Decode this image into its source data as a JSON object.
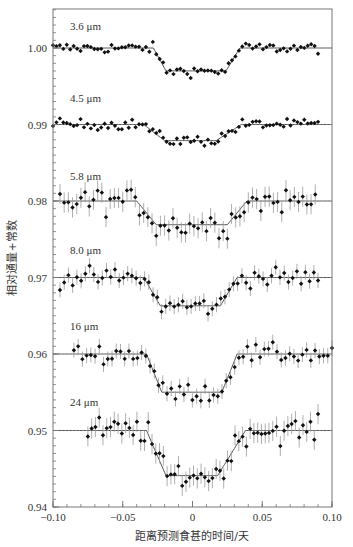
{
  "chart_data": {
    "type": "scatter",
    "title": "",
    "xlabel": "距离预测食甚的时间/天",
    "ylabel": "相对通量+常数",
    "xlim": [
      -0.1,
      0.1
    ],
    "ylim": [
      0.94,
      1.005
    ],
    "x_ticks": [
      -0.1,
      -0.05,
      0,
      0.05,
      0.1
    ],
    "x_tick_labels": [
      "−0.10",
      "−0.05",
      "0",
      "0.05",
      "0.10"
    ],
    "y_ticks": [
      0.94,
      0.95,
      0.96,
      0.97,
      0.98,
      0.99,
      1.0
    ],
    "y_tick_labels": [
      "0.94",
      "0.95",
      "0.96",
      "0.97",
      "0.98",
      "0.99",
      "1.00"
    ],
    "grid": false,
    "legend": "none (series labelled inline above each curve)",
    "series": [
      {
        "name": "3.6 μm",
        "baseline": 1.0,
        "depth": 0.003,
        "ingress": [
          -0.028,
          -0.019
        ],
        "egress": [
          0.024,
          0.034
        ],
        "errorbars": false,
        "noise": 0.0005,
        "x_range": [
          -0.1,
          0.09
        ]
      },
      {
        "name": "4.5 μm",
        "baseline": 0.99,
        "depth": 0.0021,
        "ingress": [
          -0.035,
          -0.02
        ],
        "egress": [
          0.017,
          0.035
        ],
        "errorbars": false,
        "noise": 0.0005,
        "x_range": [
          -0.1,
          0.09
        ]
      },
      {
        "name": "5.8 μm",
        "baseline": 0.98,
        "depth": 0.0031,
        "ingress": [
          -0.04,
          -0.026
        ],
        "egress": [
          0.025,
          0.039
        ],
        "errorbars": true,
        "noise": 0.0012,
        "x_range": [
          -0.095,
          0.088
        ]
      },
      {
        "name": "8.0 μm",
        "baseline": 0.97,
        "depth": 0.0037,
        "ingress": [
          -0.035,
          -0.023
        ],
        "egress": [
          0.02,
          0.032
        ],
        "errorbars": true,
        "noise": 0.0009,
        "x_range": [
          -0.095,
          0.09
        ]
      },
      {
        "name": "16 μm",
        "baseline": 0.96,
        "depth": 0.005,
        "ingress": [
          -0.033,
          -0.022
        ],
        "egress": [
          0.021,
          0.032
        ],
        "errorbars": true,
        "noise": 0.0009,
        "x_range": [
          -0.085,
          0.1
        ]
      },
      {
        "name": "24 μm",
        "baseline": 0.95,
        "depth": 0.0059,
        "ingress": [
          -0.033,
          -0.019
        ],
        "egress": [
          0.018,
          0.038
        ],
        "errorbars": true,
        "noise": 0.0012,
        "x_range": [
          -0.075,
          0.09
        ]
      }
    ],
    "annotations": [
      "3.6 μm",
      "4.5 μm",
      "5.8 μm",
      "8.0 μm",
      "16 μm",
      "24 μm"
    ]
  },
  "style": {
    "point_color": "#111111",
    "line_color": "#555555",
    "axis_color": "#777777",
    "errorbar_color": "#9a9a9a"
  }
}
